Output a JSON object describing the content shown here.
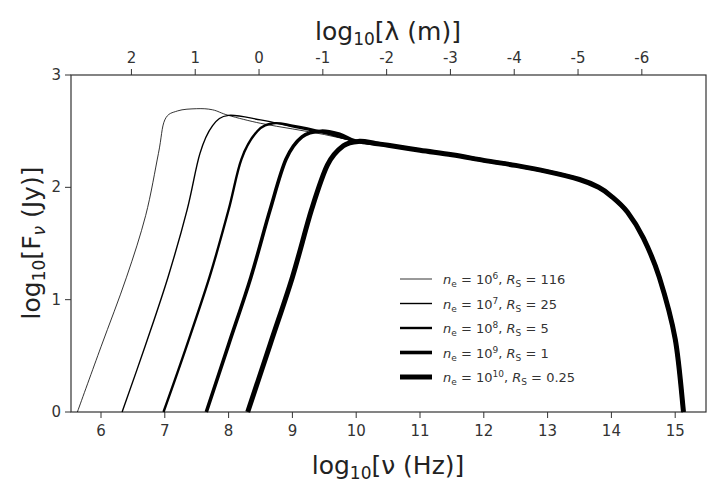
{
  "chart_data": {
    "type": "line",
    "title": "",
    "xlabel": "log10[ν (Hz)]",
    "ylabel": "log10[Fν (Jy)]",
    "x2label": "log10[λ (m)]",
    "xlim": [
      5.5,
      15.5
    ],
    "ylim": [
      0,
      3
    ],
    "xticks": [
      6,
      7,
      8,
      9,
      10,
      11,
      12,
      13,
      14,
      15
    ],
    "yticks": [
      0,
      1,
      2,
      3
    ],
    "x2ticks": [
      {
        "label": "2",
        "nu": 6.477
      },
      {
        "label": "1",
        "nu": 7.477
      },
      {
        "label": "0",
        "nu": 8.477
      },
      {
        "label": "-1",
        "nu": 9.477
      },
      {
        "label": "-2",
        "nu": 10.477
      },
      {
        "label": "-3",
        "nu": 11.477
      },
      {
        "label": "-4",
        "nu": 12.477
      },
      {
        "label": "-5",
        "nu": 13.477
      },
      {
        "label": "-6",
        "nu": 14.477
      }
    ],
    "grid": false,
    "legend_position": "lower center-right inside",
    "common_tail": [
      [
        10.0,
        2.41
      ],
      [
        10.5,
        2.375
      ],
      [
        11.0,
        2.33
      ],
      [
        11.5,
        2.29
      ],
      [
        12.0,
        2.24
      ],
      [
        12.5,
        2.195
      ],
      [
        13.0,
        2.14
      ],
      [
        13.5,
        2.07
      ],
      [
        13.8,
        2.0
      ],
      [
        14.0,
        1.92
      ],
      [
        14.25,
        1.78
      ],
      [
        14.5,
        1.55
      ],
      [
        14.75,
        1.2
      ],
      [
        15.0,
        0.65
      ],
      [
        15.13,
        0.0
      ]
    ],
    "series": [
      {
        "name": "n_e = 10^6, R_S = 116",
        "ne_exp": "6",
        "rs": "116",
        "width": 0.8,
        "x": [
          5.63,
          6.0,
          6.4,
          6.7,
          6.9,
          7.0,
          7.2,
          7.5,
          7.75,
          8.0,
          8.5,
          9.0,
          9.5,
          10.0
        ],
        "y": [
          0.0,
          0.58,
          1.2,
          1.75,
          2.3,
          2.6,
          2.68,
          2.7,
          2.69,
          2.64,
          2.57,
          2.52,
          2.47,
          2.41
        ]
      },
      {
        "name": "n_e = 10^7, R_S = 25",
        "ne_exp": "7",
        "rs": "25",
        "width": 1.4,
        "x": [
          6.33,
          6.7,
          7.05,
          7.35,
          7.55,
          7.75,
          8.0,
          8.5,
          9.0,
          9.5,
          10.0
        ],
        "y": [
          0.0,
          0.6,
          1.2,
          1.8,
          2.3,
          2.55,
          2.64,
          2.6,
          2.54,
          2.48,
          2.41
        ],
        "x_peak": 8.0,
        "y_peak": 2.64
      },
      {
        "name": "n_e = 10^8, R_S = 5",
        "ne_exp": "8",
        "rs": "5",
        "width": 2.4,
        "x": [
          6.98,
          7.35,
          7.7,
          8.0,
          8.2,
          8.45,
          8.7,
          9.0,
          9.5,
          10.0
        ],
        "y": [
          0.0,
          0.6,
          1.2,
          1.8,
          2.25,
          2.5,
          2.57,
          2.55,
          2.49,
          2.41
        ],
        "x_peak": 8.7,
        "y_peak": 2.57
      },
      {
        "name": "n_e = 10^9, R_S = 1",
        "ne_exp": "9",
        "rs": "1",
        "width": 3.6,
        "x": [
          7.65,
          8.0,
          8.35,
          8.65,
          8.9,
          9.15,
          9.45,
          9.75,
          10.0
        ],
        "y": [
          0.0,
          0.6,
          1.2,
          1.8,
          2.25,
          2.45,
          2.5,
          2.47,
          2.41
        ],
        "x_peak": 9.45,
        "y_peak": 2.5
      },
      {
        "name": "n_e = 10^10, R_S = 0.25",
        "ne_exp": "10",
        "rs": "0.25",
        "width": 5.0,
        "x": [
          8.3,
          8.65,
          9.0,
          9.3,
          9.55,
          9.8,
          10.05,
          10.3
        ],
        "y": [
          0.0,
          0.6,
          1.2,
          1.8,
          2.2,
          2.37,
          2.41,
          2.39
        ],
        "x_peak": 10.05,
        "y_peak": 2.41
      }
    ]
  },
  "legend": {
    "entries": [
      {
        "ne": "10",
        "ne_exp": "6",
        "rs": "116",
        "width": 0.8
      },
      {
        "ne": "10",
        "ne_exp": "7",
        "rs": "25",
        "width": 1.4
      },
      {
        "ne": "10",
        "ne_exp": "8",
        "rs": "5",
        "width": 2.4
      },
      {
        "ne": "10",
        "ne_exp": "9",
        "rs": "1",
        "width": 3.6
      },
      {
        "ne": "10",
        "ne_exp": "10",
        "rs": "0.25",
        "width": 5.0
      }
    ]
  },
  "axes": {
    "x_title_main": "log",
    "x_title_sub": "10",
    "x_title_rest": "[ν (Hz)]",
    "y_title_main": "log",
    "y_title_sub": "10",
    "y_title_rest_a": "[F",
    "y_title_rest_sub": "ν",
    "y_title_rest_b": " (Jy)]",
    "top_title_main": "log",
    "top_title_sub": "10",
    "top_title_rest": "[λ (m)]"
  },
  "colors": {
    "line": "#000000",
    "axis": "#333333",
    "background": "#ffffff"
  }
}
